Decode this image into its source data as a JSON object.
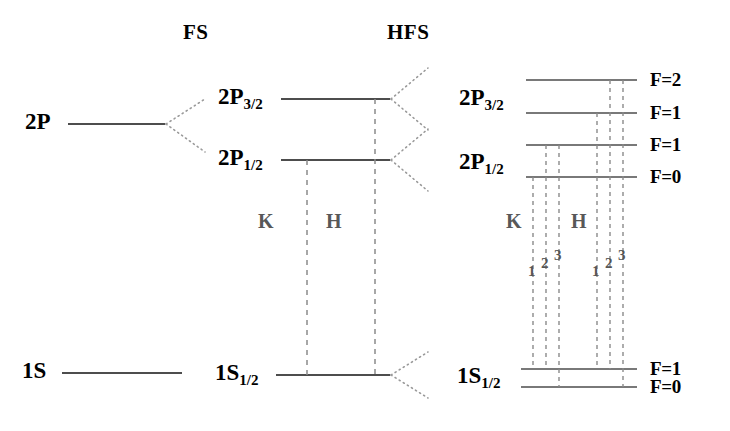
{
  "figure": {
    "type": "energy-level-diagram"
  },
  "headers": {
    "fs": "FS",
    "hfs": "HFS"
  },
  "gross_structure": {
    "levels": [
      {
        "label": "2P",
        "y": 124
      },
      {
        "label": "1S",
        "y": 373
      }
    ]
  },
  "fine_structure": {
    "levels": [
      {
        "base": "2P",
        "sub": "3/2",
        "y": 99
      },
      {
        "base": "2P",
        "sub": "1/2",
        "y": 160
      },
      {
        "base": "1S",
        "sub": "1/2",
        "y": 375
      }
    ],
    "groups": [
      {
        "label": "K",
        "x": 265,
        "y": 222
      },
      {
        "label": "H",
        "x": 332,
        "y": 222
      }
    ]
  },
  "hyperfine_structure": {
    "levels": [
      {
        "base": "2P",
        "sub": "3/2",
        "f": "F=2",
        "y": 80
      },
      {
        "base": "2P",
        "sub": "3/2",
        "f": "F=1",
        "y": 113
      },
      {
        "base": "2P",
        "sub": "1/2",
        "f": "F=1",
        "y": 145
      },
      {
        "base": "2P",
        "sub": "1/2",
        "f": "F=0",
        "y": 177
      },
      {
        "base": "1S",
        "sub": "1/2",
        "f": "F=1",
        "y": 369
      },
      {
        "base": "1S",
        "sub": "1/2",
        "f": "F=0",
        "y": 387
      }
    ],
    "term_labels": [
      {
        "base": "2P",
        "sub": "3/2"
      },
      {
        "base": "2P",
        "sub": "1/2"
      },
      {
        "base": "1S",
        "sub": "1/2"
      }
    ],
    "f_labels": [
      "F=2",
      "F=1",
      "F=1",
      "F=0",
      "F=1",
      "F=0"
    ],
    "groups": [
      {
        "label": "K",
        "x": 513,
        "y": 222,
        "transitions": [
          {
            "num": "1",
            "x": 534,
            "y": 271
          },
          {
            "num": "2",
            "x": 547,
            "y": 263
          },
          {
            "num": "3",
            "x": 560,
            "y": 255
          }
        ]
      },
      {
        "label": "H",
        "x": 578,
        "y": 222,
        "transitions": [
          {
            "num": "1",
            "x": 598,
            "y": 271
          },
          {
            "num": "2",
            "x": 611,
            "y": 263
          },
          {
            "num": "3",
            "x": 624,
            "y": 255
          }
        ]
      }
    ]
  },
  "colors": {
    "level_line": "#4d4d4d",
    "dashed_line": "#8a8a8a",
    "dotted_fan": "#9a9a9a",
    "text": "#000000",
    "group_text": "#585858",
    "background": "#ffffff"
  }
}
